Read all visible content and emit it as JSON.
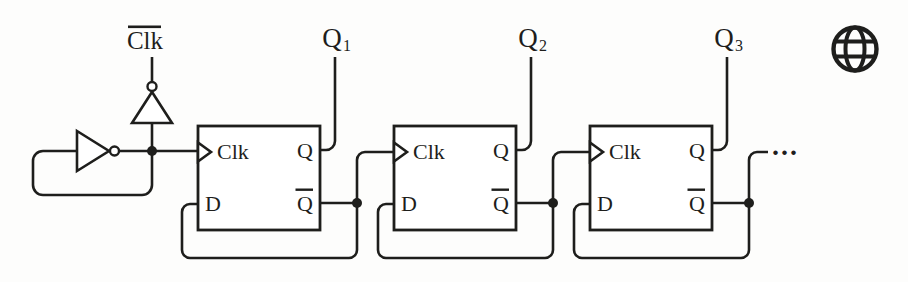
{
  "figure": {
    "background_color": "#fdfdfc",
    "ink_color": "#1e1e1c",
    "clock_source": {
      "label": "Clk",
      "overline": true
    },
    "flip_flops": [
      {
        "name": "flip-flop-1",
        "ports": {
          "clk": "Clk",
          "d": "D",
          "q": "Q",
          "qbar": "Q",
          "qbar_overline": true
        },
        "output": {
          "base": "Q",
          "sub": "1"
        }
      },
      {
        "name": "flip-flop-2",
        "ports": {
          "clk": "Clk",
          "d": "D",
          "q": "Q",
          "qbar": "Q",
          "qbar_overline": true
        },
        "output": {
          "base": "Q",
          "sub": "2"
        }
      },
      {
        "name": "flip-flop-3",
        "ports": {
          "clk": "Clk",
          "d": "D",
          "q": "Q",
          "qbar": "Q",
          "qbar_overline": true
        },
        "output": {
          "base": "Q",
          "sub": "3"
        }
      }
    ],
    "continuation_ellipsis": "...",
    "icons": [
      {
        "name": "globe-icon"
      }
    ]
  }
}
